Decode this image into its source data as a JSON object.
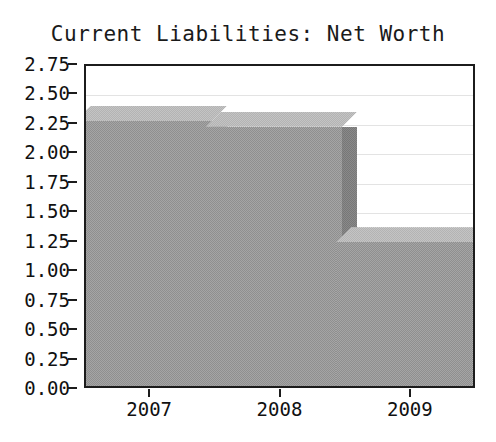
{
  "chart_data": {
    "type": "bar",
    "title": "Current Liabilities: Net Worth",
    "categories": [
      "2007",
      "2008",
      "2009"
    ],
    "values": [
      2.25,
      2.2,
      1.22
    ],
    "xlabel": "",
    "ylabel": "",
    "ylim": [
      0.0,
      2.75
    ],
    "ytick_labels": [
      "2.75",
      "2.50",
      "2.25",
      "2.00",
      "1.75",
      "1.50",
      "1.25",
      "1.00",
      "0.75",
      "0.50",
      "0.25",
      "0.00"
    ],
    "ytick_values": [
      2.75,
      2.5,
      2.25,
      2.0,
      1.75,
      1.5,
      1.25,
      1.0,
      0.75,
      0.5,
      0.25,
      0.0
    ],
    "grid": true,
    "legend": false,
    "legend_position": "none",
    "style": "3d-bar",
    "colors": {
      "bar_front": "#a5a5a5",
      "bar_top": "#c4c4c4",
      "bar_side": "#8a8a8a",
      "plot_background": "#ffffff",
      "axis": "#1c1c1c",
      "gridline": "#e3e3e3",
      "text": "#111111"
    }
  }
}
